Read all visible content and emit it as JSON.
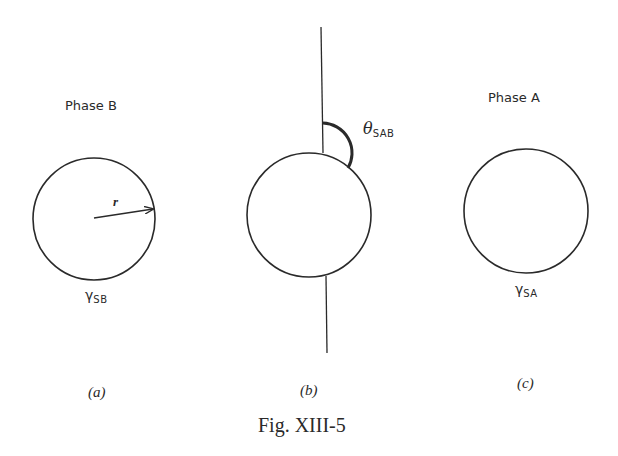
{
  "figure": {
    "caption": "Fig. XIII-5",
    "colors": {
      "stroke": "#2a2a2a",
      "background": "#ffffff"
    },
    "panels": [
      {
        "id": "a",
        "label": "(a)",
        "title": "Phase B",
        "surface_tension_symbol": "γ",
        "surface_tension_subscript": "SB",
        "radius_label": "r"
      },
      {
        "id": "b",
        "label": "(b)",
        "angle_symbol": "θ",
        "angle_subscript": "SAB"
      },
      {
        "id": "c",
        "label": "(c)",
        "title": "Phase A",
        "surface_tension_symbol": "γ",
        "surface_tension_subscript": "SA"
      }
    ]
  }
}
